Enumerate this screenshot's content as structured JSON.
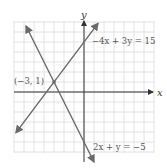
{
  "chart_data": {
    "type": "line",
    "title": "",
    "xlabel": "x",
    "ylabel": "y",
    "xlim": [
      -7,
      7
    ],
    "ylim": [
      -6,
      7
    ],
    "grid": true,
    "grid_step": 1,
    "series": [
      {
        "name": "2x + y = -5",
        "equation": "y = -2x - 5",
        "x": [
          -5.8,
          1.0
        ],
        "y": [
          6.6,
          -7.0
        ],
        "arrows": "both"
      },
      {
        "name": "-4x + 3y = 15",
        "equation": "y = (4/3)x + 5",
        "x": [
          -6.8,
          1.4
        ],
        "y": [
          -4.07,
          6.87
        ],
        "arrows": "both"
      }
    ],
    "annotations": [
      {
        "text": "(−3, 1)",
        "x": -3,
        "y": 1,
        "type": "intersection-point"
      }
    ]
  },
  "labels": {
    "x_axis": "x",
    "y_axis": "y",
    "line1": "−4x + 3y = 15",
    "line2": "2x + y = −5",
    "point": "(−3, 1)"
  },
  "colors": {
    "grid": "#e2e2e2",
    "axis": "#333333",
    "line": "#6a6a6a",
    "text": "#555555"
  }
}
